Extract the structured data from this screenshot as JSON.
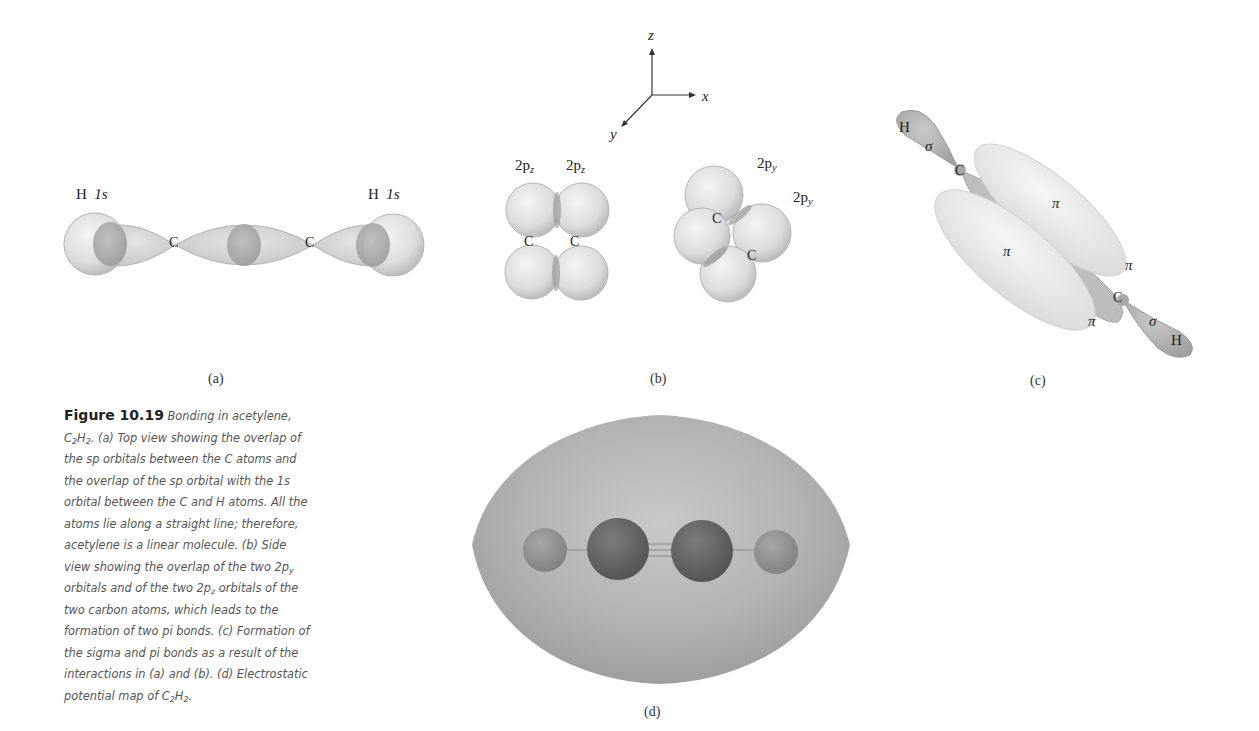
{
  "figure": {
    "number": "Figure 10.19",
    "caption_lines": [
      {
        "pre": "Bonding in acetylene,"
      },
      {
        "pre": "C",
        "sub1": "2",
        "mid": "H",
        "sub2": "2",
        "post": ". (a) Top view showing the overlap of"
      },
      {
        "pre": "the sp orbitals between the C atoms and"
      },
      {
        "pre": "the overlap of the sp orbital with the 1s"
      },
      {
        "pre": "orbital between the C and H atoms. All the"
      },
      {
        "pre": "atoms lie along a straight line; therefore,"
      },
      {
        "pre": "acetylene is a linear molecule. (b) Side"
      },
      {
        "pre": "view showing the overlap of the two 2p",
        "sub1": "y"
      },
      {
        "pre": "orbitals and of the two 2p",
        "sub1": "z",
        "mid": " orbitals of the"
      },
      {
        "pre": "two carbon atoms, which leads to the"
      },
      {
        "pre": "formation of two pi bonds. (c) Formation of"
      },
      {
        "pre": "the sigma and pi bonds as a result of the"
      },
      {
        "pre": "interactions in (a) and (b). (d) Electrostatic"
      },
      {
        "pre": "potential map of C",
        "sub1": "2",
        "mid": "H",
        "sub2": "2",
        "post": "."
      }
    ]
  },
  "panel_a": {
    "label": "(a)",
    "left_atom": "H",
    "left_orbital": "1s",
    "right_atom": "H",
    "right_orbital": "1s",
    "carbon_left": "C",
    "carbon_right": "C"
  },
  "panel_b": {
    "label": "(b)",
    "axes": {
      "z": "z",
      "x": "x",
      "y": "y"
    },
    "pz_label_1": "2p",
    "pz_sub_1": "z",
    "pz_label_2": "2p",
    "pz_sub_2": "z",
    "py_label_1": "2p",
    "py_sub_1": "y",
    "py_label_2": "2p",
    "py_sub_2": "y",
    "carbon": "C"
  },
  "panel_c": {
    "label": "(c)",
    "hydrogen": "H",
    "carbon": "C",
    "sigma": "σ",
    "pi": "π"
  },
  "panel_d": {
    "label": "(d)"
  },
  "colors": {
    "orbital_light": "#e6e6e6",
    "orbital_mid": "#c8c8c8",
    "orbital_dark": "#a8a8a8",
    "overlap": "#9c9c9c",
    "esp_body": "#b5b5b5",
    "esp_carbon": "#6a6a6a",
    "esp_hydrogen": "#929292"
  }
}
